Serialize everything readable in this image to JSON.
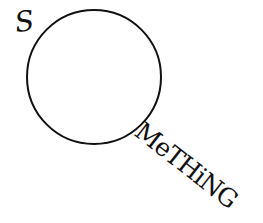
{
  "logo": {
    "first_letter": "S",
    "circle_letter": "O",
    "tail_text": "MeTHiNG",
    "full_word": "SOMeTHiNG",
    "ink_color": "#111111",
    "background_color": "#ffffff"
  }
}
